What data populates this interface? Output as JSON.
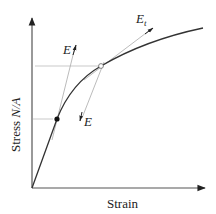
{
  "diagram": {
    "type": "stress-strain curve with tangent and secant moduli",
    "x_axis": {
      "label": "Strain"
    },
    "y_axis": {
      "label_prefix": "Stress ",
      "label_italic": "N/A"
    },
    "annotations": {
      "initial_modulus_label": "E",
      "tangent_modulus_label": "E",
      "tangent_modulus_subscript": "t",
      "secant_modulus_label": "E"
    },
    "points": {
      "proportional_limit": "filled dot",
      "tangent_point": "open circle"
    },
    "colors": {
      "curve": "#333333",
      "axes": "#555555",
      "guide_lines": "#bbbbbb",
      "tangent_lines": "#aaaaaa"
    }
  }
}
